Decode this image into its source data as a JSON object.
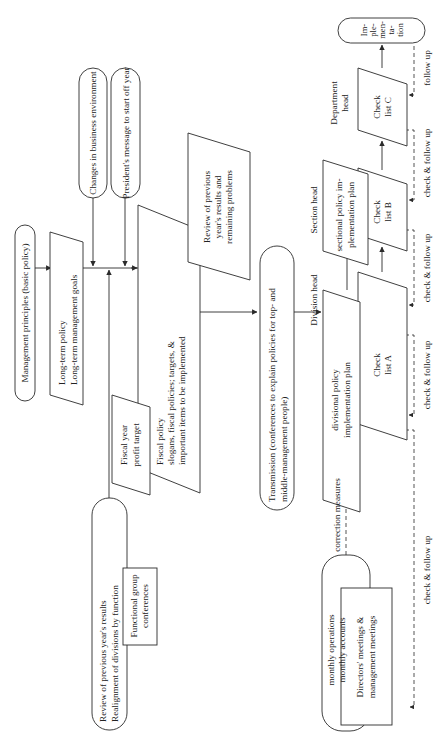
{
  "diagram": {
    "nodes": {
      "management_principles": "Management principles (basic policy)",
      "long_term_policy": [
        "Long-term policy",
        "Long-term management goals"
      ],
      "changes_env": "Changes in business environment",
      "presidents_message": "President's message to start off year",
      "fiscal_profit_target": [
        "Fiscal year",
        "profit target"
      ],
      "fiscal_policy": [
        "Fiscal policy",
        "slogans, fiscal policies; targets, &",
        "important items to be implemented"
      ],
      "review_prev_problems": [
        "Review of previous",
        "year's results and",
        "remaining problems"
      ],
      "review_realignment": [
        "Review of previous year's results",
        "Realignment of divisions by function"
      ],
      "functional_group": [
        "Functional group",
        "conferences"
      ],
      "transmission": [
        "Transmission (conferences to explain policies for top- and",
        "middle-management people)"
      ],
      "division_plan": [
        "divisional policy",
        "implementation plan"
      ],
      "section_plan": [
        "sectional policy im-",
        "plementation plan"
      ],
      "check_list_a": [
        "Check",
        "list A"
      ],
      "check_list_b": [
        "Check",
        "list B"
      ],
      "check_list_c": [
        "Check",
        "list C"
      ],
      "implementation": [
        "Im-",
        "ple-",
        "men-",
        "ta-",
        "tion"
      ],
      "monthly_ops": [
        "monthly operations",
        "monthly accounts"
      ],
      "directors_meetings": [
        "Directors' meetings &",
        "management meetings"
      ]
    },
    "labels": {
      "division_head": "Division head",
      "section_head": "Section head",
      "department_head": [
        "Department",
        "head"
      ],
      "correction_measures": "correction measures",
      "check_follow_up": "check & follow up",
      "follow_up": "follow up"
    }
  }
}
